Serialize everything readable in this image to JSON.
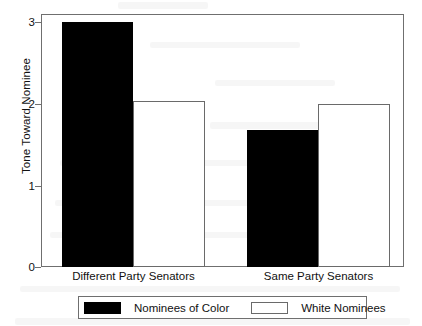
{
  "chart_data": {
    "type": "bar",
    "title": "",
    "subtitle": "",
    "xlabel": "",
    "ylabel": "Tone Toward Nominee",
    "categories": [
      "Different Party Senators",
      "Same Party Senators"
    ],
    "series": [
      {
        "name": "Nominees of Color",
        "color": "#000000",
        "values": [
          3.0,
          1.68
        ]
      },
      {
        "name": "White Nominees",
        "color": "#ffffff",
        "values": [
          2.03,
          2.0
        ]
      }
    ],
    "ylim": [
      0,
      3.1
    ],
    "yticks": [
      "0",
      "1",
      "2",
      "3"
    ],
    "ytick_values": [
      0,
      1,
      2,
      3
    ],
    "grid": false,
    "legend_position": "bottom",
    "frame": true
  },
  "axis": {
    "y_title": "Tone Toward Nominee",
    "y_labels": [
      "3",
      "2",
      "1",
      "0"
    ],
    "x_labels": [
      "Different Party Senators",
      "Same Party Senators"
    ]
  },
  "legend": {
    "entries": [
      {
        "label": "Nominees of Color",
        "swatch": "black-filled-swatch"
      },
      {
        "label": "White Nominees",
        "swatch": "white-outlined-swatch"
      }
    ]
  },
  "colors": {
    "series_dark": "#000000",
    "series_light": "#ffffff",
    "frame": "#6f6f6f",
    "text": "#111111",
    "background": "#ffffff"
  }
}
